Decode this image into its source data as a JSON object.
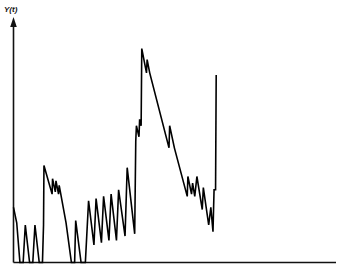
{
  "chart_data": {
    "type": "line",
    "title": "",
    "subtitle": "",
    "xlabel": "",
    "ylabel": "Y(t)",
    "grid": false,
    "legend": null,
    "annotations": [],
    "xlim": [
      0,
      100
    ],
    "ylim": [
      0,
      100
    ],
    "axis_style": {
      "y_axis": "arrow",
      "x_axis": "plain-line",
      "ticks": "none",
      "tick_labels": "none"
    },
    "series": [
      {
        "name": "Y(t)",
        "color": "#000000",
        "line_width": 1.6,
        "points": [
          [
            0.0,
            25.0
          ],
          [
            1.5,
            18.0
          ],
          [
            3.0,
            0.0
          ],
          [
            4.5,
            0.0
          ],
          [
            5.5,
            17.0
          ],
          [
            7.5,
            0.0
          ],
          [
            9.0,
            0.0
          ],
          [
            10.0,
            17.0
          ],
          [
            12.0,
            0.0
          ],
          [
            13.5,
            0.0
          ],
          [
            14.0,
            17.0
          ],
          [
            14.2,
            44.0
          ],
          [
            18.0,
            31.0
          ],
          [
            18.2,
            38.0
          ],
          [
            19.5,
            32.0
          ],
          [
            19.8,
            37.0
          ],
          [
            21.0,
            31.0
          ],
          [
            21.3,
            35.0
          ],
          [
            24.5,
            18.0
          ],
          [
            27.0,
            0.0
          ],
          [
            28.5,
            0.0
          ],
          [
            29.0,
            19.0
          ],
          [
            31.5,
            0.0
          ],
          [
            33.5,
            0.0
          ],
          [
            35.0,
            28.0
          ],
          [
            37.5,
            8.0
          ],
          [
            38.5,
            29.0
          ],
          [
            41.0,
            9.0
          ],
          [
            42.0,
            30.0
          ],
          [
            44.5,
            10.0
          ],
          [
            45.5,
            31.0
          ],
          [
            48.0,
            10.0
          ],
          [
            49.0,
            33.0
          ],
          [
            52.0,
            12.0
          ],
          [
            53.0,
            43.0
          ],
          [
            56.5,
            13.0
          ],
          [
            57.0,
            55.0
          ],
          [
            57.3,
            62.0
          ],
          [
            58.5,
            57.0
          ],
          [
            58.8,
            65.0
          ],
          [
            59.5,
            62.0
          ],
          [
            59.8,
            97.0
          ],
          [
            62.0,
            86.0
          ],
          [
            62.3,
            92.0
          ],
          [
            63.5,
            86.0
          ],
          [
            72.5,
            52.0
          ],
          [
            72.8,
            62.0
          ],
          [
            75.0,
            52.0
          ],
          [
            81.0,
            30.0
          ],
          [
            81.3,
            39.0
          ],
          [
            83.0,
            31.0
          ],
          [
            83.5,
            36.0
          ],
          [
            84.5,
            30.0
          ],
          [
            85.5,
            39.0
          ],
          [
            88.0,
            24.0
          ],
          [
            88.5,
            34.0
          ],
          [
            91.0,
            17.0
          ],
          [
            92.0,
            25.0
          ],
          [
            93.0,
            14.0
          ],
          [
            93.5,
            33.0
          ],
          [
            94.2,
            33.0
          ],
          [
            94.5,
            85.0
          ]
        ]
      }
    ]
  },
  "axis": {
    "y_label": "Y(t)"
  },
  "colors": {
    "line": "#000000",
    "axis": "#111111",
    "background": "#ffffff"
  }
}
